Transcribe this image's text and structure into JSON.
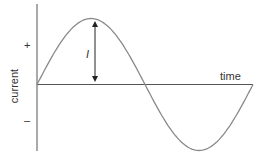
{
  "diagram": {
    "type": "sine-wave",
    "labels": {
      "y_axis": "current",
      "x_axis": "time",
      "positive": "+",
      "negative": "–",
      "amplitude": "I"
    },
    "colors": {
      "curve": "#8a8a8a",
      "axes": "#555555",
      "arrow": "#222222",
      "text": "#333333"
    }
  },
  "chart_data": {
    "type": "line",
    "title": "",
    "xlabel": "time",
    "ylabel": "current",
    "series": [
      {
        "name": "current",
        "function": "I·sin(2πt/T)",
        "x": [
          0,
          0.25,
          0.5,
          0.75,
          1.0
        ],
        "values": [
          0,
          1,
          0,
          -1,
          0
        ]
      }
    ],
    "annotations": [
      {
        "text": "I",
        "meaning": "peak amplitude, double-headed arrow from axis to crest"
      },
      {
        "text": "+",
        "position": "upper y-axis"
      },
      {
        "text": "–",
        "position": "lower y-axis"
      }
    ],
    "grid": false
  }
}
